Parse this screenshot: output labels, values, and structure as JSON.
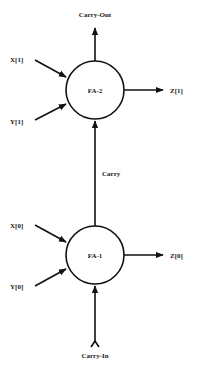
{
  "diagram": {
    "nodes": [
      {
        "id": "fa2",
        "label": "FA-2"
      },
      {
        "id": "fa1",
        "label": "FA-1"
      }
    ],
    "labels": {
      "carry_out": "Carry-Out",
      "x1": "X[1]",
      "y1": "Y[1]",
      "z1": "Z[1]",
      "carry": "Carry",
      "x0": "X[0]",
      "y0": "Y[0]",
      "z0": "Z[0]",
      "carry_in": "Carry-In"
    },
    "edges": [
      {
        "from": "X[1]",
        "to": "FA-2"
      },
      {
        "from": "Y[1]",
        "to": "FA-2"
      },
      {
        "from": "FA-2",
        "to": "Carry-Out"
      },
      {
        "from": "FA-2",
        "to": "Z[1]"
      },
      {
        "from": "FA-1",
        "to": "FA-2",
        "label": "Carry"
      },
      {
        "from": "X[0]",
        "to": "FA-1"
      },
      {
        "from": "Y[0]",
        "to": "FA-1"
      },
      {
        "from": "FA-1",
        "to": "Z[0]"
      },
      {
        "from": "Carry-In",
        "to": "FA-1"
      }
    ]
  }
}
